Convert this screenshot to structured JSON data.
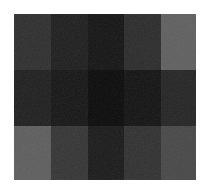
{
  "canvas": {
    "width": 209,
    "height": 194,
    "background": "#ffffff",
    "description": "Grayscale checker grid of flat tonal blocks"
  },
  "grid": {
    "left": 14,
    "top": 14,
    "width": 182,
    "height": 166,
    "columns": 5,
    "rows": 3,
    "column_edges": [
      14,
      51,
      88,
      124,
      161,
      196
    ],
    "row_edges": [
      14,
      70,
      126,
      180
    ],
    "column_widths": [
      37,
      37,
      36,
      37,
      35
    ],
    "row_heights": [
      56,
      56,
      54
    ]
  },
  "chart_data": {
    "type": "heatmap",
    "title": "",
    "xlabel": "",
    "ylabel": "",
    "columns": [
      "c1",
      "c2",
      "c3",
      "c4",
      "c5"
    ],
    "rows": [
      "r1",
      "r2",
      "r3"
    ],
    "colorscale": "grayscale",
    "value_range": [
      10,
      94
    ],
    "note": "Values are 8-bit gray levels sampled from each block",
    "values": [
      [
        46,
        30,
        20,
        43,
        94
      ],
      [
        31,
        22,
        10,
        19,
        36
      ],
      [
        92,
        52,
        26,
        48,
        70
      ]
    ]
  },
  "blocks": [
    {
      "name": "block-r1-c1",
      "row": 1,
      "col": 1,
      "color": "#2e2e2e",
      "gray": 46
    },
    {
      "name": "block-r1-c2",
      "row": 1,
      "col": 2,
      "color": "#1e1e1e",
      "gray": 30
    },
    {
      "name": "block-r1-c3",
      "row": 1,
      "col": 3,
      "color": "#141414",
      "gray": 20
    },
    {
      "name": "block-r1-c4",
      "row": 1,
      "col": 4,
      "color": "#2b2b2b",
      "gray": 43
    },
    {
      "name": "block-r1-c5",
      "row": 1,
      "col": 5,
      "color": "#5e5e5e",
      "gray": 94
    },
    {
      "name": "block-r2-c1",
      "row": 2,
      "col": 1,
      "color": "#1f1f1f",
      "gray": 31
    },
    {
      "name": "block-r2-c2",
      "row": 2,
      "col": 2,
      "color": "#161616",
      "gray": 22
    },
    {
      "name": "block-r2-c3",
      "row": 2,
      "col": 3,
      "color": "#0a0a0a",
      "gray": 10
    },
    {
      "name": "block-r2-c4",
      "row": 2,
      "col": 4,
      "color": "#131313",
      "gray": 19
    },
    {
      "name": "block-r2-c5",
      "row": 2,
      "col": 5,
      "color": "#242424",
      "gray": 36
    },
    {
      "name": "block-r3-c1",
      "row": 3,
      "col": 1,
      "color": "#5c5c5c",
      "gray": 92
    },
    {
      "name": "block-r3-c2",
      "row": 3,
      "col": 2,
      "color": "#343434",
      "gray": 52
    },
    {
      "name": "block-r3-c3",
      "row": 3,
      "col": 3,
      "color": "#1a1a1a",
      "gray": 26
    },
    {
      "name": "block-r3-c4",
      "row": 3,
      "col": 4,
      "color": "#303030",
      "gray": 48
    },
    {
      "name": "block-r3-c5",
      "row": 3,
      "col": 5,
      "color": "#464646",
      "gray": 70
    }
  ]
}
